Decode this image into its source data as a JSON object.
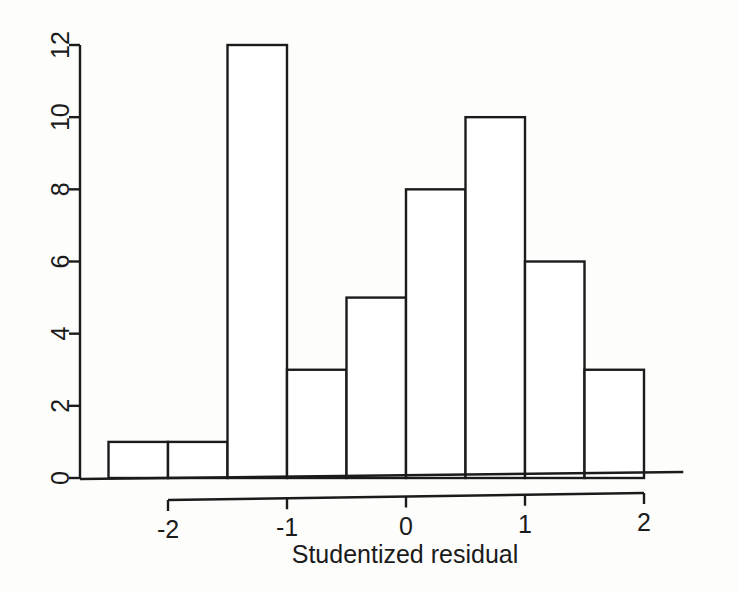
{
  "chart_data": {
    "type": "bar",
    "subtype": "histogram",
    "title": "",
    "xlabel": "Studentized residual",
    "ylabel": "",
    "categories": [
      "[-2.5,-2)",
      "[-2,-1.5)",
      "[-1.5,-1)",
      "[-1,-0.5)",
      "[-0.5,0)",
      "[0,0.5)",
      "[0.5,1)",
      "[1,1.5)",
      "[1.5,2]"
    ],
    "bin_edges": [
      -2.5,
      -2.0,
      -1.5,
      -1.0,
      -0.5,
      0.0,
      0.5,
      1.0,
      1.5,
      2.0
    ],
    "bin_width": 0.5,
    "values": [
      1,
      1,
      12,
      3,
      5,
      8,
      10,
      6,
      3
    ],
    "total_count": 49,
    "xlim": [
      -2.6,
      2.35
    ],
    "ylim": [
      0,
      12.4
    ],
    "x_ticks": [
      -2,
      -1,
      0,
      1,
      2
    ],
    "x_tick_labels": [
      "-2",
      "-1",
      "0",
      "1",
      "2"
    ],
    "y_ticks": [
      0,
      2,
      4,
      6,
      8,
      10,
      12
    ],
    "y_tick_labels": [
      "0",
      "2",
      "4",
      "6",
      "8",
      "10",
      "12"
    ],
    "grid": false,
    "legend": false,
    "bar_fill": "#ffffff",
    "bar_stroke": "#1b1b1b",
    "axis_color": "#1b1b1b",
    "background": "#fdfdfc",
    "y_tick_label_rotation": -90
  }
}
